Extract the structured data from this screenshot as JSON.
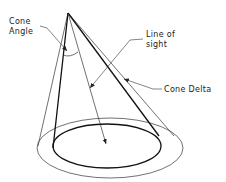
{
  "diagram": {
    "labels": {
      "cone_angle_line1": "Cone",
      "cone_angle_line2": "Angle",
      "line_of_sight_line1": "Line  of",
      "line_of_sight_line2": "sight",
      "cone_delta": "Cone  Delta"
    },
    "colors": {
      "background": "#ffffff",
      "stroke": "#222222"
    }
  }
}
